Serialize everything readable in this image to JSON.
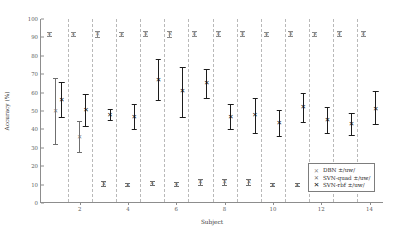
{
  "chart_data": {
    "type": "scatter",
    "title": "",
    "xlabel": "Subject",
    "ylabel": "Accuracy (%)",
    "xlim": [
      0.4,
      14.6
    ],
    "ylim": [
      0,
      100
    ],
    "yticks": [
      0,
      10,
      20,
      30,
      40,
      50,
      60,
      70,
      80,
      90,
      100
    ],
    "ytick_labels": [
      "0",
      "10",
      "20",
      "30",
      "40",
      "50",
      "60",
      "70",
      "80",
      "90",
      "100"
    ],
    "xticks": [
      2,
      4,
      6,
      8,
      10,
      12,
      14
    ],
    "xtick_labels": [
      "2",
      "4",
      "6",
      "8",
      "10",
      "12",
      "14"
    ],
    "grid": "vertical-dashed-group-separators",
    "legend_position": "bottom-right",
    "categories": [
      1,
      2,
      3,
      4,
      5,
      6,
      7,
      8,
      9,
      10,
      11,
      12,
      13,
      14
    ],
    "marker": "x",
    "errorbars": "mean +/- std",
    "series": [
      {
        "name": "DBN ±/uw/",
        "key": "dbn",
        "color": "#8a8a8a",
        "values": [
          92,
          92,
          92,
          92,
          92,
          92,
          92,
          92,
          92,
          92,
          92,
          92,
          92,
          92
        ],
        "err_low": [
          1.2,
          1.2,
          1.6,
          1.2,
          1.3,
          1.6,
          1.3,
          1.3,
          1.4,
          1.2,
          1.3,
          1.2,
          1.3,
          1.3
        ],
        "err_high": [
          1.2,
          1.2,
          1.6,
          1.2,
          1.3,
          1.6,
          1.3,
          1.3,
          1.4,
          1.2,
          1.3,
          1.2,
          1.3,
          1.3
        ]
      },
      {
        "name": "SVN-quad ±/uw/",
        "key": "quad",
        "color": "#6f6f6f",
        "values": [
          50,
          36,
          10.5,
          10,
          11,
          10.5,
          11.5,
          11.5,
          11.5,
          10,
          10,
          10.5,
          9,
          11.5
        ],
        "err_low": [
          18,
          8.5,
          1.5,
          0.8,
          1.2,
          1.0,
          1.5,
          1.8,
          1.5,
          0.8,
          0.7,
          1.5,
          1.0,
          1.5
        ],
        "err_high": [
          18,
          8.5,
          1.5,
          0.8,
          1.2,
          1.0,
          1.5,
          1.8,
          1.5,
          0.8,
          0.7,
          1.5,
          1.0,
          1.5
        ]
      },
      {
        "name": "SVN-rbf ±/uw/",
        "key": "rbf",
        "color": "#111111",
        "values": [
          56,
          50.5,
          48,
          47,
          67,
          61,
          65,
          47,
          48,
          43.5,
          52,
          45,
          43,
          51
        ],
        "err_low": [
          9,
          8.5,
          3,
          7,
          11,
          14,
          8,
          7,
          10,
          7,
          8,
          7,
          6,
          8
        ],
        "err_high": [
          10,
          9,
          3,
          7,
          11,
          13,
          8,
          7,
          9,
          7,
          8,
          7,
          6,
          10
        ]
      }
    ]
  },
  "legend": {
    "marker_glyph": "✕",
    "entries": [
      {
        "label": "DBN ±/uw/"
      },
      {
        "label": "SVN-quad ±/uw/"
      },
      {
        "label": "SVN-rbf ±/uw/"
      }
    ]
  },
  "axes": {
    "ylabel": "Accuracy (%)",
    "xlabel": "Subject"
  }
}
